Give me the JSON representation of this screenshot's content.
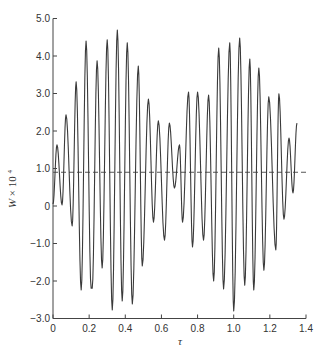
{
  "chart_data": {
    "type": "line",
    "title": "",
    "xlabel": "τ",
    "ylabel": "W × 10⁴",
    "ylabel_parts": {
      "var": "W",
      "mult": "× 10",
      "exp": "4"
    },
    "xlim": [
      0,
      1.4
    ],
    "ylim": [
      -3.0,
      5.0
    ],
    "x_ticks": [
      "0",
      "0.2",
      "0.4",
      "0.6",
      "0.8",
      "1.0",
      "1.2",
      "1.4"
    ],
    "x_tick_values": [
      0,
      0.2,
      0.4,
      0.6,
      0.8,
      1.0,
      1.2,
      1.4
    ],
    "y_ticks": [
      "5.0",
      "4.0",
      "3.0",
      "2.0",
      "1.0",
      "0",
      "−1.0",
      "−2.0",
      "−3.0"
    ],
    "y_tick_values": [
      5,
      4,
      3,
      2,
      1,
      0,
      -1,
      -2,
      -3
    ],
    "grid": false,
    "reference_line": {
      "y": 0.9,
      "style": "dashed",
      "label": "mean"
    },
    "series": [
      {
        "name": "W",
        "x": [
          0.0,
          0.022,
          0.05,
          0.072,
          0.106,
          0.128,
          0.156,
          0.183,
          0.211,
          0.217,
          0.244,
          0.272,
          0.3,
          0.328,
          0.356,
          0.383,
          0.411,
          0.439,
          0.472,
          0.494,
          0.528,
          0.556,
          0.583,
          0.617,
          0.644,
          0.672,
          0.7,
          0.717,
          0.75,
          0.772,
          0.8,
          0.833,
          0.861,
          0.889,
          0.917,
          0.944,
          0.978,
          1.0,
          1.033,
          1.061,
          1.089,
          1.111,
          1.139,
          1.167,
          1.194,
          1.233,
          1.25,
          1.278,
          1.306,
          1.328,
          1.35
        ],
        "values": [
          0.05,
          1.63,
          0.03,
          2.43,
          -0.53,
          3.31,
          -2.24,
          4.4,
          -2.19,
          -2.19,
          3.87,
          -1.65,
          4.43,
          -2.77,
          4.69,
          -2.53,
          4.35,
          -2.61,
          3.73,
          -1.6,
          2.85,
          -0.43,
          2.27,
          -0.91,
          2.21,
          0.48,
          1.63,
          -0.43,
          3.04,
          -1.09,
          3.04,
          -0.91,
          2.96,
          -2.0,
          4.21,
          -2.21,
          4.35,
          -2.8,
          4.48,
          -2.11,
          3.92,
          -2.24,
          3.68,
          -1.71,
          2.91,
          -1.17,
          2.99,
          -0.35,
          1.81,
          0.35,
          2.21
        ]
      }
    ],
    "peaks": [
      {
        "x": 0.022,
        "y": 1.63
      },
      {
        "x": 0.078,
        "y": 2.43
      },
      {
        "x": 0.133,
        "y": 3.31
      },
      {
        "x": 0.183,
        "y": 4.4
      },
      {
        "x": 0.244,
        "y": 3.87
      },
      {
        "x": 0.3,
        "y": 4.43
      },
      {
        "x": 0.356,
        "y": 4.69
      },
      {
        "x": 0.411,
        "y": 4.35
      },
      {
        "x": 0.472,
        "y": 3.73
      },
      {
        "x": 0.528,
        "y": 2.85
      },
      {
        "x": 0.583,
        "y": 2.27
      },
      {
        "x": 0.644,
        "y": 2.21
      },
      {
        "x": 0.7,
        "y": 1.63
      },
      {
        "x": 0.744,
        "y": 3.04
      },
      {
        "x": 0.8,
        "y": 3.04
      },
      {
        "x": 0.861,
        "y": 2.96
      },
      {
        "x": 0.917,
        "y": 4.21
      },
      {
        "x": 0.972,
        "y": 4.35
      },
      {
        "x": 1.033,
        "y": 4.48
      },
      {
        "x": 1.089,
        "y": 3.92
      },
      {
        "x": 1.139,
        "y": 3.68
      },
      {
        "x": 1.194,
        "y": 2.91
      },
      {
        "x": 1.261,
        "y": 2.99
      },
      {
        "x": 1.311,
        "y": 1.81
      },
      {
        "x": 1.356,
        "y": 2.21
      }
    ],
    "troughs": [
      {
        "x": 0.05,
        "y": 0.03
      },
      {
        "x": 0.106,
        "y": -0.53
      },
      {
        "x": 0.156,
        "y": -2.24
      },
      {
        "x": 0.217,
        "y": -2.19
      },
      {
        "x": 0.272,
        "y": -1.65
      },
      {
        "x": 0.328,
        "y": -2.77
      },
      {
        "x": 0.383,
        "y": -2.53
      },
      {
        "x": 0.444,
        "y": -2.61
      },
      {
        "x": 0.5,
        "y": -1.6
      },
      {
        "x": 0.556,
        "y": -0.43
      },
      {
        "x": 0.617,
        "y": -0.91
      },
      {
        "x": 0.672,
        "y": 0.48
      },
      {
        "x": 0.717,
        "y": -0.43
      },
      {
        "x": 0.772,
        "y": -1.09
      },
      {
        "x": 0.828,
        "y": -0.91
      },
      {
        "x": 0.889,
        "y": -2.0
      },
      {
        "x": 0.944,
        "y": -2.21
      },
      {
        "x": 1.0,
        "y": -2.8
      },
      {
        "x": 1.061,
        "y": -2.11
      },
      {
        "x": 1.117,
        "y": -2.24
      },
      {
        "x": 1.167,
        "y": -1.71
      },
      {
        "x": 1.228,
        "y": -1.17
      },
      {
        "x": 1.278,
        "y": -0.35
      },
      {
        "x": 1.328,
        "y": 0.35
      },
      {
        "x": 1.378,
        "y": -0.64
      }
    ]
  }
}
